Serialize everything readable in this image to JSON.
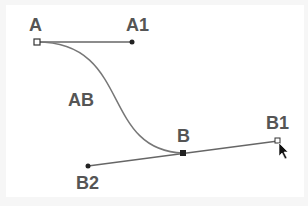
{
  "diagram": {
    "type": "bezier-curve",
    "colors": {
      "background": "#ffffff",
      "stroke": "#666666",
      "curve": "#777777",
      "label": "#555555",
      "point": "#222222"
    },
    "points": {
      "A": {
        "label": "A",
        "x": 37,
        "y": 42,
        "marker": "hollow-square"
      },
      "A1": {
        "label": "A1",
        "x": 132,
        "y": 42,
        "marker": "dot"
      },
      "B": {
        "label": "B",
        "x": 183,
        "y": 153,
        "marker": "filled-square"
      },
      "B1": {
        "label": "B1",
        "x": 278,
        "y": 141,
        "marker": "hollow-square"
      },
      "B2": {
        "label": "B2",
        "x": 88,
        "y": 166,
        "marker": "dot"
      }
    },
    "curve_label": "AB",
    "cursor": "arrow-pointer"
  }
}
